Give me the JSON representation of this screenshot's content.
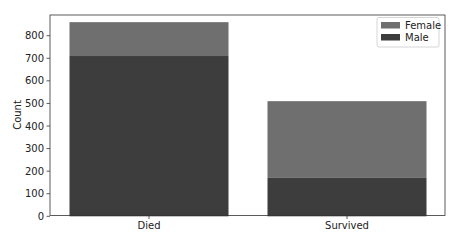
{
  "chart_data": {
    "type": "bar",
    "stacked": true,
    "title": "",
    "xlabel": "",
    "ylabel": "Count",
    "categories": [
      "Died",
      "Survived"
    ],
    "series": [
      {
        "name": "Male",
        "values": [
          710,
          170
        ],
        "color": "#3d3d3d"
      },
      {
        "name": "Female",
        "values": [
          150,
          340
        ],
        "color": "#6f6f6f"
      }
    ],
    "ylim": [
      0,
      890
    ],
    "yticks": [
      0,
      100,
      200,
      300,
      400,
      500,
      600,
      700,
      800
    ],
    "grid": false,
    "legend": {
      "position": "upper right",
      "entries": [
        "Female",
        "Male"
      ]
    }
  }
}
